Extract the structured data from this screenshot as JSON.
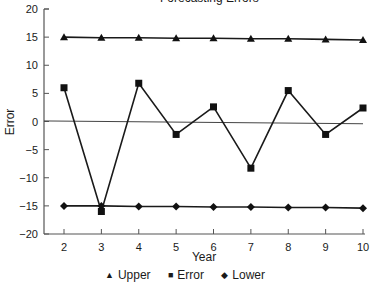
{
  "chart_data": {
    "type": "line",
    "title": "Forecasting Errors",
    "xlabel": "Year",
    "ylabel": "Error",
    "x": [
      2,
      3,
      4,
      5,
      6,
      7,
      8,
      9,
      10
    ],
    "ylim": [
      -20,
      20
    ],
    "yticks": [
      20,
      15,
      10,
      5,
      0,
      -5,
      -10,
      -15,
      -20
    ],
    "xticks": [
      2,
      3,
      4,
      5,
      6,
      7,
      8,
      9,
      10
    ],
    "grid": false,
    "legend_position": "bottom",
    "series": [
      {
        "name": "Upper",
        "marker": "triangle",
        "values": [
          15.0,
          14.9,
          14.9,
          14.8,
          14.8,
          14.7,
          14.7,
          14.6,
          14.5
        ]
      },
      {
        "name": "Error",
        "marker": "square",
        "values": [
          6.0,
          -16.0,
          6.8,
          -2.3,
          2.6,
          -8.3,
          5.5,
          -2.3,
          2.4
        ]
      },
      {
        "name": "Lower",
        "marker": "diamond",
        "values": [
          -15.0,
          -15.0,
          -15.1,
          -15.1,
          -15.2,
          -15.2,
          -15.3,
          -15.3,
          -15.4
        ]
      }
    ],
    "reference_line": {
      "name": "zero",
      "start": 0.1,
      "end": -0.4
    }
  },
  "legend": {
    "items": [
      {
        "symbol": "▲",
        "label": "Upper"
      },
      {
        "symbol": "■",
        "label": "Error"
      },
      {
        "symbol": "◆",
        "label": "Lower"
      }
    ]
  }
}
